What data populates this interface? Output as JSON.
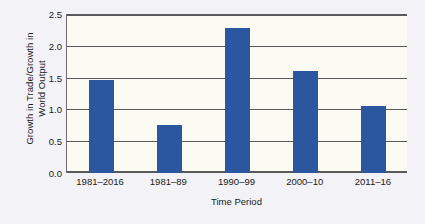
{
  "chart_data": {
    "type": "bar",
    "title": "",
    "subtitle": "",
    "xlabel": "Time Period",
    "ylabel": "Growth in Trade/Growth in World Output",
    "ylabel_line1": "Growth in Trade/Growth in",
    "ylabel_line2": "World Output",
    "categories": [
      "1981–2016",
      "1981–89",
      "1990–99",
      "2000–10",
      "2011–16"
    ],
    "values": [
      1.47,
      0.75,
      2.28,
      1.6,
      1.05
    ],
    "series": [
      {
        "name": "Growth in Trade/Growth in World Output",
        "values": [
          1.47,
          0.75,
          2.28,
          1.6,
          1.05
        ]
      }
    ],
    "ylim": [
      0.0,
      2.5
    ],
    "ytick_labels": [
      "0.0",
      "0.5",
      "1.0",
      "1.5",
      "2.0",
      "2.5"
    ],
    "ytick_values": [
      0.0,
      0.5,
      1.0,
      1.5,
      2.0,
      2.5
    ],
    "grid": true,
    "grid_axis": "y",
    "legend": false,
    "legend_position": "none",
    "bar_color": "#2b57a0",
    "plot_background": "#fbfbf4",
    "figure_background": "#f2f2f7",
    "gridline_color": "#58585b",
    "axis_color": "#6d6d70"
  }
}
